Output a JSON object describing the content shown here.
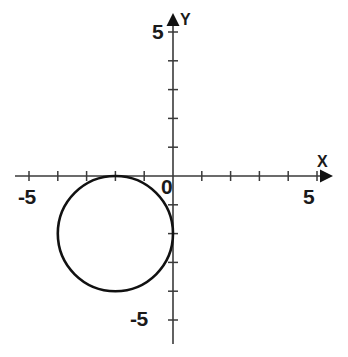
{
  "figure": {
    "title": "",
    "background_color": "#ffffff",
    "ink_color": "#2b2b2b",
    "curve_color": "#111111"
  },
  "axes": {
    "x_axis_name": "X",
    "y_axis_name": "Y",
    "origin_label": "0",
    "x_tick_labels": {
      "negative": "-5",
      "positive": "5"
    },
    "y_tick_labels": {
      "negative": "-5",
      "positive": "5"
    }
  },
  "chart_data": {
    "type": "line",
    "title": "",
    "xlabel": "X",
    "ylabel": "Y",
    "xlim": [
      -5.5,
      5.5
    ],
    "ylim": [
      -5.5,
      5.5
    ],
    "grid": false,
    "legend": null,
    "x_ticks": [
      -5,
      -4,
      -3,
      -2,
      -1,
      0,
      1,
      2,
      3,
      4,
      5
    ],
    "y_ticks": [
      -5,
      -4,
      -3,
      -2,
      -1,
      0,
      1,
      2,
      3,
      4,
      5
    ],
    "x_tick_labels_shown": [
      "-5",
      "0",
      "5"
    ],
    "y_tick_labels_shown": [
      "-5",
      "0",
      "5"
    ],
    "annotations": [],
    "series": [
      {
        "name": "circle",
        "shape": "circle",
        "center": [
          -2,
          -2
        ],
        "radius": 2,
        "equation": "(x + 2)^2 + (y + 2)^2 = 4",
        "closed": true,
        "stroke_width_px": 2.6,
        "points": [
          [
            0.0,
            -2.0
          ],
          [
            -0.04,
            -1.6
          ],
          [
            -0.15,
            -1.22
          ],
          [
            -0.34,
            -0.88
          ],
          [
            -0.59,
            -0.59
          ],
          [
            -0.88,
            -0.34
          ],
          [
            -1.22,
            -0.15
          ],
          [
            -1.6,
            -0.04
          ],
          [
            -2.0,
            0.0
          ],
          [
            -2.4,
            -0.04
          ],
          [
            -2.78,
            -0.15
          ],
          [
            -3.12,
            -0.34
          ],
          [
            -3.41,
            -0.59
          ],
          [
            -3.66,
            -0.88
          ],
          [
            -3.85,
            -1.22
          ],
          [
            -3.96,
            -1.6
          ],
          [
            -4.0,
            -2.0
          ],
          [
            -3.96,
            -2.4
          ],
          [
            -3.85,
            -2.78
          ],
          [
            -3.66,
            -3.12
          ],
          [
            -3.41,
            -3.41
          ],
          [
            -3.12,
            -3.66
          ],
          [
            -2.78,
            -3.85
          ],
          [
            -2.4,
            -3.96
          ],
          [
            -2.0,
            -4.0
          ],
          [
            -1.6,
            -3.96
          ],
          [
            -1.22,
            -3.85
          ],
          [
            -0.88,
            -3.66
          ],
          [
            -0.59,
            -3.41
          ],
          [
            -0.34,
            -3.12
          ],
          [
            -0.15,
            -2.78
          ],
          [
            -0.04,
            -2.4
          ],
          [
            0.0,
            -2.0
          ]
        ]
      }
    ]
  },
  "geometry": {
    "origin_px": [
      173,
      176
    ],
    "unit_px": 28.8,
    "x_axis_span_px": [
      15,
      332
    ],
    "y_axis_span_px": [
      14,
      344
    ]
  }
}
